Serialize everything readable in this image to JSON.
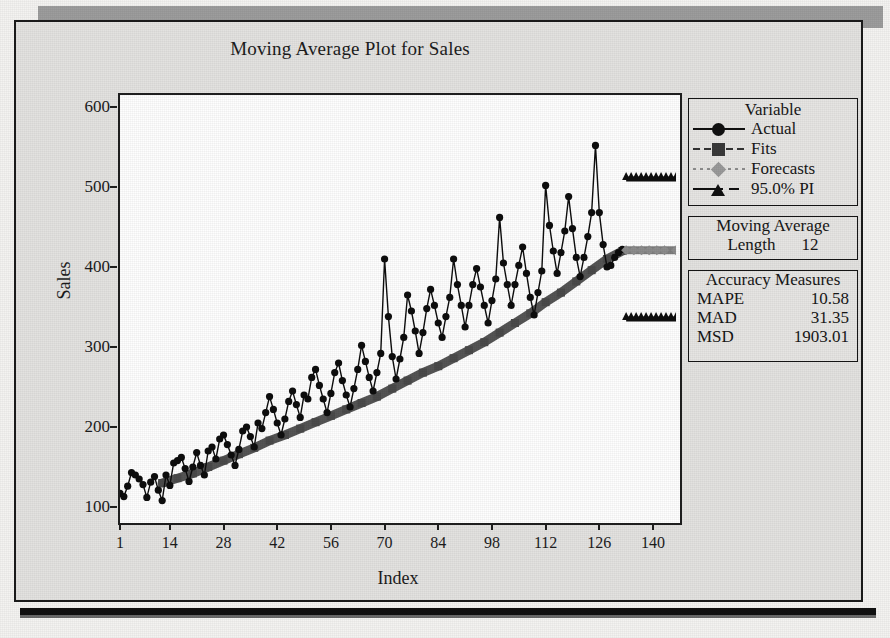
{
  "title": "Moving Average Plot for Sales",
  "axes": {
    "ylabel": "Sales",
    "xlabel": "Index",
    "yticks": [
      "100",
      "200",
      "300",
      "400",
      "500",
      "600"
    ],
    "xticks": [
      "1",
      "14",
      "28",
      "42",
      "56",
      "70",
      "84",
      "98",
      "112",
      "126",
      "140"
    ]
  },
  "legend": {
    "header": "Variable",
    "items": [
      {
        "label": "Actual",
        "marker": "circle",
        "line": "solid",
        "color": "#111111"
      },
      {
        "label": "Fits",
        "marker": "square",
        "line": "dashed",
        "color": "#3a3a3a"
      },
      {
        "label": "Forecasts",
        "marker": "diamond",
        "line": "dotted",
        "color": "#9a9a9a"
      },
      {
        "label": "95.0% PI",
        "marker": "tri",
        "line": "pi",
        "color": "#111111"
      }
    ]
  },
  "moving_average": {
    "header_line1": "Moving  Average",
    "length_label": "Length",
    "length_value": "12"
  },
  "accuracy": {
    "header": "Accuracy  Measures",
    "rows": [
      {
        "name": "MAPE",
        "value": "10.58"
      },
      {
        "name": "MAD",
        "value": "31.35"
      },
      {
        "name": "MSD",
        "value": "1903.01"
      }
    ]
  },
  "chart_data": {
    "type": "line",
    "title": "Moving Average Plot for Sales",
    "xlabel": "Index",
    "ylabel": "Sales",
    "xlim": [
      1,
      146
    ],
    "ylim": [
      85,
      615
    ],
    "grid": false,
    "legend_position": "right-outside",
    "moving_average_length": 12,
    "accuracy_measures": {
      "MAPE": 10.58,
      "MAD": 31.35,
      "MSD": 1903.01
    },
    "annotations": [
      "Seasonal series with rising trend; 12-period moving average fit",
      "Forecasts flat at about 420 for indices 133-146",
      "95% prediction interval about 335 to 510"
    ],
    "series": [
      {
        "name": "Actual",
        "marker": "circle",
        "x": [
          1,
          2,
          3,
          4,
          5,
          6,
          7,
          8,
          9,
          10,
          11,
          12,
          13,
          14,
          15,
          16,
          17,
          18,
          19,
          20,
          21,
          22,
          23,
          24,
          25,
          26,
          27,
          28,
          29,
          30,
          31,
          32,
          33,
          34,
          35,
          36,
          37,
          38,
          39,
          40,
          41,
          42,
          43,
          44,
          45,
          46,
          47,
          48,
          49,
          50,
          51,
          52,
          53,
          54,
          55,
          56,
          57,
          58,
          59,
          60,
          61,
          62,
          63,
          64,
          65,
          66,
          67,
          68,
          69,
          70,
          71,
          72,
          73,
          74,
          75,
          76,
          77,
          78,
          79,
          80,
          81,
          82,
          83,
          84,
          85,
          86,
          87,
          88,
          89,
          90,
          91,
          92,
          93,
          94,
          95,
          96,
          97,
          98,
          99,
          100,
          101,
          102,
          103,
          104,
          105,
          106,
          107,
          108,
          109,
          110,
          111,
          112,
          113,
          114,
          115,
          116,
          117,
          118,
          119,
          120,
          121,
          122,
          123,
          124,
          125,
          126,
          127,
          128,
          129,
          130,
          131,
          132
        ],
        "values": [
          117,
          113,
          126,
          143,
          140,
          135,
          128,
          112,
          131,
          138,
          121,
          108,
          140,
          127,
          155,
          158,
          162,
          148,
          132,
          150,
          168,
          152,
          140,
          170,
          175,
          160,
          185,
          190,
          178,
          165,
          152,
          172,
          195,
          200,
          188,
          175,
          205,
          198,
          218,
          238,
          222,
          205,
          190,
          210,
          232,
          245,
          228,
          212,
          240,
          235,
          262,
          272,
          252,
          235,
          218,
          242,
          268,
          280,
          258,
          240,
          225,
          248,
          272,
          302,
          282,
          262,
          245,
          268,
          292,
          410,
          338,
          288,
          260,
          285,
          312,
          365,
          345,
          320,
          292,
          318,
          348,
          372,
          352,
          330,
          312,
          338,
          362,
          410,
          378,
          352,
          325,
          352,
          378,
          398,
          375,
          352,
          330,
          358,
          385,
          462,
          405,
          378,
          352,
          378,
          402,
          425,
          392,
          362,
          340,
          368,
          395,
          502,
          452,
          420,
          392,
          418,
          445,
          488,
          448,
          412,
          388,
          412,
          438,
          468,
          552,
          468,
          428,
          400,
          402,
          412,
          418,
          422
        ]
      },
      {
        "name": "Fits",
        "marker": "square",
        "x": [
          12,
          16,
          20,
          24,
          28,
          32,
          36,
          40,
          44,
          48,
          52,
          56,
          60,
          64,
          68,
          72,
          76,
          80,
          84,
          88,
          92,
          96,
          100,
          104,
          108,
          112,
          116,
          120,
          124,
          128,
          132
        ],
        "values": [
          130,
          136,
          142,
          150,
          158,
          166,
          174,
          183,
          190,
          198,
          206,
          214,
          222,
          230,
          238,
          248,
          258,
          268,
          276,
          286,
          296,
          306,
          318,
          330,
          342,
          356,
          368,
          382,
          396,
          410,
          420
        ]
      },
      {
        "name": "Forecasts",
        "marker": "diamond",
        "x": [
          133,
          135,
          137,
          139,
          141,
          143,
          146
        ],
        "values": [
          421,
          421,
          421,
          421,
          421,
          421,
          421
        ]
      },
      {
        "name": "95.0% PI Upper",
        "marker": "tri",
        "x": [
          133,
          135,
          137,
          139,
          141,
          143,
          146
        ],
        "values": [
          510,
          510,
          510,
          510,
          510,
          510,
          510
        ]
      },
      {
        "name": "95.0% PI Lower",
        "marker": "tri",
        "x": [
          133,
          135,
          137,
          139,
          141,
          143,
          146
        ],
        "values": [
          335,
          335,
          335,
          335,
          335,
          335,
          335
        ]
      }
    ]
  }
}
